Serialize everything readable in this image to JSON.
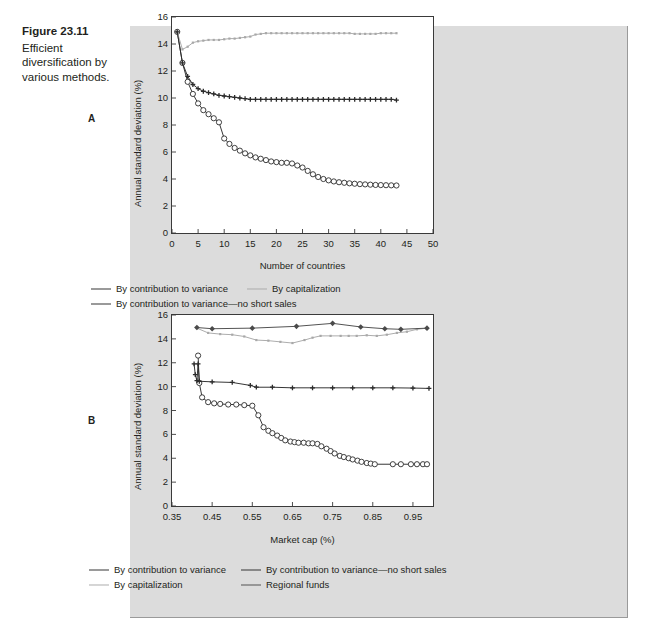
{
  "caption": {
    "figure_number": "Figure 23.11",
    "figure_text": "Efficient diversification by various methods."
  },
  "panels": {
    "a_letter": "A",
    "b_letter": "B"
  },
  "colors": {
    "page_background": "#ffffff",
    "figure_panel": "#dcdcdc",
    "plot_background": "#ffffff",
    "axis": "#3a3a3a",
    "series_contribution": "#2b2b2b",
    "series_no_short_sales": "#2b2b2b",
    "series_capitalization": "#a8a8a8",
    "series_regional_funds": "#4a4a4a",
    "text": "#231f20"
  },
  "legend_a": [
    {
      "label": "By contribution to variance",
      "marker": "open-circle-line",
      "color": "#2b2b2b"
    },
    {
      "label": "By capitalization",
      "marker": "small-dot-line",
      "color": "#a8a8a8"
    },
    {
      "label": "By contribution to variance—no short sales",
      "marker": "filled-plus-line",
      "color": "#2b2b2b"
    }
  ],
  "legend_b": [
    {
      "label": "By contribution to variance",
      "marker": "open-circle-line",
      "color": "#2b2b2b"
    },
    {
      "label": "By contribution to variance—no short sales",
      "marker": "filled-plus-line",
      "color": "#2b2b2b"
    },
    {
      "label": "By capitalization",
      "marker": "small-dot-line",
      "color": "#a8a8a8"
    },
    {
      "label": "Regional funds",
      "marker": "filled-diamond-line",
      "color": "#4a4a4a"
    }
  ],
  "chart_data": [
    {
      "id": "panel-a",
      "type": "line",
      "title": "",
      "panel_label": "A",
      "xlabel": "Number of countries",
      "ylabel": "Annual standard deviation (%)",
      "xlim": [
        0,
        50
      ],
      "ylim": [
        0,
        16
      ],
      "xticks": [
        0,
        5,
        10,
        15,
        20,
        25,
        30,
        35,
        40,
        45,
        50
      ],
      "xticklabels": [
        "0",
        "5",
        "10",
        "15",
        "20",
        "25",
        "30",
        "35",
        "40",
        "45",
        "50"
      ],
      "yticks": [
        0,
        2,
        4,
        6,
        8,
        10,
        12,
        14,
        16
      ],
      "yticklabels": [
        "0",
        "2",
        "4",
        "6",
        "8",
        "10",
        "12",
        "14",
        "16"
      ],
      "grid": false,
      "legend_position": "below",
      "series": [
        {
          "name": "By contribution to variance",
          "marker": "open-circle",
          "color": "#2b2b2b",
          "x": [
            1,
            2,
            3,
            4,
            5,
            6,
            7,
            8,
            9,
            10,
            11,
            12,
            13,
            14,
            15,
            16,
            17,
            18,
            19,
            20,
            21,
            22,
            23,
            24,
            25,
            26,
            27,
            28,
            29,
            30,
            31,
            32,
            33,
            34,
            35,
            36,
            37,
            38,
            39,
            40,
            41,
            42,
            43
          ],
          "y": [
            14.9,
            12.6,
            11.2,
            10.3,
            9.6,
            9.1,
            8.8,
            8.5,
            8.2,
            7.0,
            6.6,
            6.3,
            6.1,
            5.9,
            5.75,
            5.6,
            5.5,
            5.4,
            5.3,
            5.25,
            5.2,
            5.2,
            5.15,
            5.0,
            4.85,
            4.6,
            4.35,
            4.15,
            4.0,
            3.9,
            3.82,
            3.76,
            3.72,
            3.68,
            3.65,
            3.62,
            3.6,
            3.58,
            3.56,
            3.55,
            3.54,
            3.53,
            3.52
          ]
        },
        {
          "name": "By capitalization",
          "marker": "small-dot",
          "color": "#a8a8a8",
          "x": [
            1,
            2,
            3,
            4,
            5,
            6,
            7,
            8,
            9,
            10,
            11,
            12,
            13,
            14,
            15,
            16,
            17,
            18,
            19,
            20,
            21,
            22,
            23,
            24,
            25,
            26,
            27,
            28,
            29,
            30,
            31,
            32,
            33,
            34,
            35,
            36,
            37,
            38,
            39,
            40,
            41,
            42,
            43
          ],
          "y": [
            14.9,
            13.6,
            13.8,
            14.1,
            14.2,
            14.25,
            14.3,
            14.3,
            14.3,
            14.35,
            14.4,
            14.4,
            14.45,
            14.5,
            14.55,
            14.7,
            14.75,
            14.8,
            14.8,
            14.8,
            14.8,
            14.8,
            14.8,
            14.8,
            14.8,
            14.8,
            14.8,
            14.8,
            14.8,
            14.8,
            14.8,
            14.8,
            14.8,
            14.8,
            14.75,
            14.75,
            14.75,
            14.75,
            14.75,
            14.8,
            14.8,
            14.8,
            14.8
          ]
        },
        {
          "name": "By contribution to variance—no short sales",
          "marker": "filled-plus",
          "color": "#2b2b2b",
          "x": [
            1,
            2,
            3,
            4,
            5,
            6,
            7,
            8,
            9,
            10,
            11,
            12,
            13,
            14,
            15,
            16,
            17,
            18,
            19,
            20,
            21,
            22,
            23,
            24,
            25,
            26,
            27,
            28,
            29,
            30,
            31,
            32,
            33,
            34,
            35,
            36,
            37,
            38,
            39,
            40,
            41,
            42,
            43
          ],
          "y": [
            14.9,
            12.6,
            11.6,
            11.0,
            10.7,
            10.5,
            10.4,
            10.3,
            10.2,
            10.15,
            10.1,
            10.05,
            10.0,
            9.95,
            9.9,
            9.9,
            9.9,
            9.9,
            9.9,
            9.9,
            9.9,
            9.9,
            9.9,
            9.9,
            9.9,
            9.9,
            9.9,
            9.9,
            9.9,
            9.9,
            9.9,
            9.9,
            9.9,
            9.9,
            9.9,
            9.9,
            9.9,
            9.9,
            9.9,
            9.9,
            9.9,
            9.9,
            9.85
          ]
        }
      ]
    },
    {
      "id": "panel-b",
      "type": "line",
      "title": "",
      "panel_label": "B",
      "xlabel": "Market cap (%)",
      "ylabel": "Annual standard deviation (%)",
      "xlim": [
        0.35,
        1.0
      ],
      "ylim": [
        0,
        16
      ],
      "xticks": [
        0.35,
        0.45,
        0.55,
        0.65,
        0.75,
        0.85,
        0.95
      ],
      "xticklabels": [
        "0.35",
        "0.45",
        "0.55",
        "0.65",
        "0.75",
        "0.85",
        "0.95"
      ],
      "yticks": [
        0,
        2,
        4,
        6,
        8,
        10,
        12,
        14,
        16
      ],
      "yticklabels": [
        "0",
        "2",
        "4",
        "6",
        "8",
        "10",
        "12",
        "14",
        "16"
      ],
      "grid": false,
      "legend_position": "below",
      "series": [
        {
          "name": "By contribution to variance",
          "marker": "open-circle",
          "color": "#2b2b2b",
          "x": [
            0.415,
            0.418,
            0.425,
            0.44,
            0.455,
            0.47,
            0.49,
            0.51,
            0.53,
            0.55,
            0.565,
            0.578,
            0.59,
            0.6,
            0.612,
            0.622,
            0.632,
            0.645,
            0.655,
            0.665,
            0.678,
            0.69,
            0.7,
            0.712,
            0.722,
            0.735,
            0.745,
            0.755,
            0.768,
            0.778,
            0.79,
            0.8,
            0.812,
            0.822,
            0.835,
            0.845,
            0.855,
            0.9,
            0.92,
            0.945,
            0.96,
            0.975,
            0.985
          ],
          "y": [
            12.6,
            10.3,
            9.1,
            8.7,
            8.6,
            8.55,
            8.5,
            8.5,
            8.45,
            8.4,
            7.6,
            6.6,
            6.3,
            6.1,
            5.9,
            5.7,
            5.5,
            5.4,
            5.35,
            5.3,
            5.3,
            5.25,
            5.25,
            5.2,
            5.0,
            4.8,
            4.6,
            4.4,
            4.2,
            4.1,
            4.0,
            3.9,
            3.8,
            3.7,
            3.6,
            3.55,
            3.5,
            3.5,
            3.5,
            3.5,
            3.5,
            3.5,
            3.5
          ]
        },
        {
          "name": "By contribution to variance—no short sales",
          "marker": "filled-plus",
          "color": "#2b2b2b",
          "x": [
            0.405,
            0.408,
            0.412,
            0.415,
            0.418,
            0.45,
            0.5,
            0.545,
            0.56,
            0.6,
            0.65,
            0.7,
            0.75,
            0.8,
            0.85,
            0.9,
            0.95,
            0.99
          ],
          "y": [
            11.9,
            11.0,
            10.5,
            11.9,
            10.45,
            10.4,
            10.35,
            10.1,
            9.95,
            9.95,
            9.9,
            9.9,
            9.9,
            9.9,
            9.9,
            9.9,
            9.88,
            9.85
          ]
        },
        {
          "name": "By capitalization",
          "marker": "small-dot",
          "color": "#a8a8a8",
          "x": [
            0.412,
            0.44,
            0.47,
            0.5,
            0.53,
            0.56,
            0.59,
            0.62,
            0.65,
            0.68,
            0.7,
            0.72,
            0.745,
            0.77,
            0.79,
            0.81,
            0.835,
            0.86,
            0.885,
            0.91,
            0.935,
            0.96,
            0.985
          ],
          "y": [
            14.9,
            14.5,
            14.4,
            14.35,
            14.2,
            13.9,
            13.85,
            13.75,
            13.65,
            13.9,
            14.1,
            14.25,
            14.25,
            14.25,
            14.25,
            14.25,
            14.3,
            14.25,
            14.35,
            14.5,
            14.6,
            14.8,
            14.9
          ]
        },
        {
          "name": "Regional funds",
          "marker": "filled-diamond",
          "color": "#4a4a4a",
          "x": [
            0.412,
            0.45,
            0.55,
            0.66,
            0.75,
            0.82,
            0.88,
            0.92,
            0.985
          ],
          "y": [
            14.95,
            14.85,
            14.9,
            15.05,
            15.3,
            15.0,
            14.85,
            14.8,
            14.9
          ]
        }
      ]
    }
  ]
}
